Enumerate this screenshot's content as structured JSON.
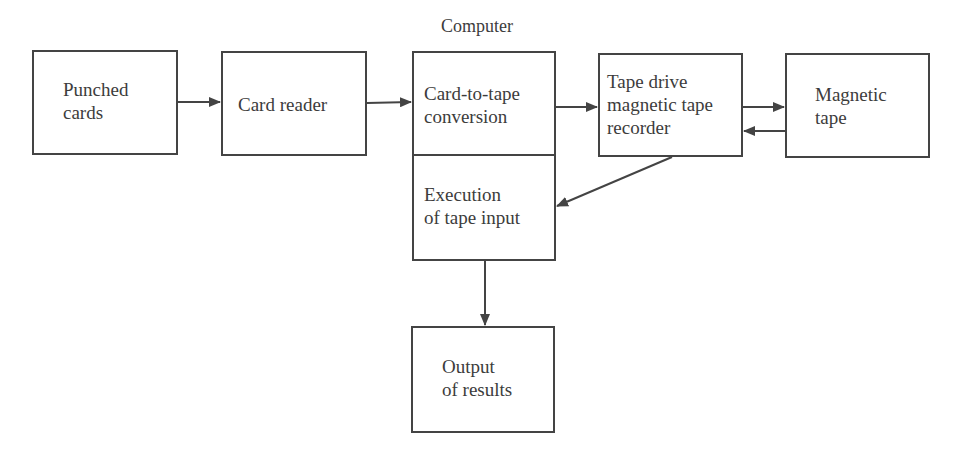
{
  "diagram": {
    "group_label": "Computer",
    "nodes": [
      {
        "id": "punched-cards",
        "label": "Punched\ncards"
      },
      {
        "id": "card-reader",
        "label": "Card reader"
      },
      {
        "id": "card-to-tape",
        "label": "Card-to-tape\nconversion"
      },
      {
        "id": "tape-drive",
        "label": "Tape drive\nmagnetic tape\nrecorder"
      },
      {
        "id": "magnetic-tape",
        "label": "Magnetic\ntape"
      },
      {
        "id": "execution",
        "label": "Execution\nof tape input"
      },
      {
        "id": "output",
        "label": "Output\nof results"
      }
    ],
    "edges": [
      {
        "from": "punched-cards",
        "to": "card-reader"
      },
      {
        "from": "card-reader",
        "to": "card-to-tape"
      },
      {
        "from": "card-to-tape",
        "to": "tape-drive"
      },
      {
        "from": "tape-drive",
        "to": "magnetic-tape"
      },
      {
        "from": "magnetic-tape",
        "to": "tape-drive"
      },
      {
        "from": "tape-drive",
        "to": "execution"
      },
      {
        "from": "execution",
        "to": "output"
      }
    ]
  }
}
